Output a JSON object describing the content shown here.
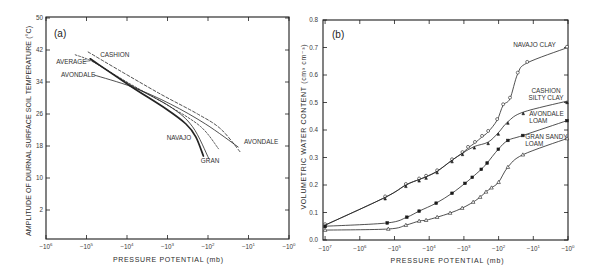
{
  "chart_data": [
    {
      "type": "line",
      "panel_label": "(a)",
      "title": "",
      "xlabel": "PRESSURE POTENTIAL (mb)",
      "ylabel": "AMPLITUDE OF DIURNAL SURFACE SOIL TEMPERATURE (°C)",
      "x_scale": "log (negative pressure potential)",
      "xlim": [
        -1000000,
        -1
      ],
      "ylim": [
        -5,
        50
      ],
      "grid": false,
      "legend": "inline curve labels",
      "x_ticks": [
        {
          "value": -1000000,
          "base": "−10",
          "exp": "6"
        },
        {
          "value": -100000,
          "base": "−10",
          "exp": "5"
        },
        {
          "value": -10000,
          "base": "−10",
          "exp": "4"
        },
        {
          "value": -1000,
          "base": "−10",
          "exp": "3"
        },
        {
          "value": -100,
          "base": "−10",
          "exp": "2"
        },
        {
          "value": -10,
          "base": "−10",
          "exp": "1"
        },
        {
          "value": -1,
          "base": "−10",
          "exp": "0"
        }
      ],
      "y_ticks": [
        {
          "value": 2,
          "label": "2"
        },
        {
          "value": 10,
          "label": "10"
        },
        {
          "value": 18,
          "label": "18"
        },
        {
          "value": 26,
          "label": "26"
        },
        {
          "value": 34,
          "label": "34"
        },
        {
          "value": 42,
          "label": "42"
        },
        {
          "value": 50,
          "label": "50"
        }
      ],
      "series": [
        {
          "name": "CASHION",
          "line_style": "dashed",
          "points": [
            [
              -91000,
              41.5
            ],
            [
              -16000,
              37.0
            ],
            [
              -1500,
              31.0
            ],
            [
              -180,
              26.0
            ],
            [
              -49,
              22.3
            ],
            [
              -16,
              16.5
            ]
          ],
          "labels": [
            {
              "lines": [
                "CASHION"
              ],
              "at": [
                -46000,
                40.25
              ],
              "anchor": "start"
            }
          ]
        },
        {
          "name": "AVERAGE",
          "line_style": "dashed-fine",
          "points": [
            [
              -190000,
              40.8
            ],
            [
              -68000,
              39.0
            ],
            [
              -8300,
              33.5
            ],
            [
              -850,
              27.8
            ],
            [
              -150,
              22.8
            ],
            [
              -55,
              17.3
            ]
          ],
          "labels": [
            {
              "lines": [
                "AVERAGE"
              ],
              "at": [
                -562000,
                38.5
              ],
              "anchor": "start",
              "leader": [
                [
                  -120000,
                  39.1
                ],
                [
                  -81000,
                  39.3
                ]
              ]
            }
          ]
        },
        {
          "name": "AVONDALE",
          "line_style": "solid",
          "points": [
            [
              -65000,
              35.75
            ],
            [
              -7400,
              32.75
            ],
            [
              -850,
              28.5
            ],
            [
              -115,
              23.5
            ],
            [
              -18,
              17.75
            ]
          ],
          "labels": [
            {
              "lines": [
                "AVONDALE"
              ],
              "at": [
                -427000,
                35.25
              ],
              "anchor": "start"
            },
            {
              "lines": [
                "AVONDALE"
              ],
              "at": [
                -13,
                18.5
              ],
              "anchor": "start"
            }
          ]
        },
        {
          "name": "NAVAJO",
          "line_style": "solid-bold",
          "points": [
            [
              -81000,
              39.8
            ],
            [
              -8300,
              33.0
            ],
            [
              -1100,
              27.3
            ],
            [
              -350,
              23.5
            ],
            [
              -200,
              20.3
            ],
            [
              -130,
              15.5
            ]
          ],
          "labels": [
            {
              "lines": [
                "NAVAJO"
              ],
              "at": [
                -1050,
                19.5
              ],
              "anchor": "start"
            }
          ]
        },
        {
          "name": "GRAN",
          "line_style": "solid",
          "points": [
            [
              -72000,
              39.3
            ],
            [
              -8300,
              33.3
            ],
            [
              -850,
              27.8
            ],
            [
              -240,
              22.8
            ],
            [
              -95,
              14.8
            ]
          ],
          "labels": [
            {
              "lines": [
                "GRAN"
              ],
              "at": [
                -150,
                13.75
              ],
              "anchor": "start"
            }
          ]
        }
      ]
    },
    {
      "type": "line",
      "panel_label": "(b)",
      "title": "",
      "xlabel": "PRESSURE POTENTIAL (mb)",
      "ylabel": "VOLUMETRIC WATER CONTENT (cm³ cm⁻³)",
      "x_scale": "log (negative pressure potential)",
      "xlim": [
        -10000000,
        -1
      ],
      "ylim": [
        0.0,
        0.8
      ],
      "grid": false,
      "legend": "inline curve labels",
      "x_ticks": [
        {
          "value": -10000000,
          "base": "−10",
          "exp": "7"
        },
        {
          "value": -1000000,
          "base": "−10",
          "exp": "6"
        },
        {
          "value": -100000,
          "base": "−10",
          "exp": "5"
        },
        {
          "value": -10000,
          "base": "−10",
          "exp": "4"
        },
        {
          "value": -1000,
          "base": "−10",
          "exp": "3"
        },
        {
          "value": -100,
          "base": "−10",
          "exp": "2"
        },
        {
          "value": -10,
          "base": "−10",
          "exp": "1"
        },
        {
          "value": -1,
          "base": "−10",
          "exp": "0"
        }
      ],
      "y_ticks": [
        {
          "value": 0.0,
          "label": "0.0"
        },
        {
          "value": 0.1,
          "label": "0.1"
        },
        {
          "value": 0.2,
          "label": "0.2"
        },
        {
          "value": 0.3,
          "label": "0.3"
        },
        {
          "value": 0.4,
          "label": "0.4"
        },
        {
          "value": 0.5,
          "label": "0.5"
        },
        {
          "value": 0.6,
          "label": "0.6"
        },
        {
          "value": 0.7,
          "label": "0.7"
        },
        {
          "value": 0.8,
          "label": "0.8"
        }
      ],
      "series": [
        {
          "name": "NAVAJO CLAY",
          "line_style": "solid",
          "marker": "circle-open",
          "points": [
            [
              -10000000,
              0.054
            ],
            [
              -186000,
              0.155
            ],
            [
              -47000,
              0.2
            ],
            [
              -19500,
              0.22
            ],
            [
              -12300,
              0.23
            ],
            [
              -5900,
              0.25
            ],
            [
              -2200,
              0.29
            ],
            [
              -1100,
              0.316
            ],
            [
              -760,
              0.335
            ],
            [
              -480,
              0.353
            ],
            [
              -300,
              0.375
            ],
            [
              -200,
              0.393
            ],
            [
              -110,
              0.436
            ],
            [
              -74,
              0.49
            ],
            [
              -47,
              0.514
            ],
            [
              -28,
              0.605
            ],
            [
              -15,
              0.644
            ],
            [
              -1.07,
              0.699
            ]
          ],
          "labels": [
            {
              "lines": [
                "NAVAJO CLAY"
              ],
              "at": [
                -38,
                0.702
              ],
              "anchor": "start"
            }
          ]
        },
        {
          "name": "CASHION SILTY CLAY",
          "line_style": "solid",
          "marker": "triangle-filled",
          "points": [
            [
              -10000000,
              0.054
            ],
            [
              -186000,
              0.155
            ],
            [
              -47000,
              0.2
            ],
            [
              -19500,
              0.22
            ],
            [
              -12300,
              0.23
            ],
            [
              -5900,
              0.25
            ],
            [
              -2200,
              0.29
            ],
            [
              -1100,
              0.316
            ],
            [
              -500,
              0.34
            ],
            [
              -200,
              0.356
            ],
            [
              -102,
              0.39
            ],
            [
              -54,
              0.43
            ],
            [
              -19.5,
              0.465
            ],
            [
              -1.07,
              0.505
            ]
          ],
          "labels": [
            {
              "lines": [
                "CASHION",
                "SILTY CLAY"
              ],
              "at": [
                -4.3,
                0.535
              ],
              "anchor": "middle"
            }
          ]
        },
        {
          "name": "AVONDALE LOAM",
          "line_style": "solid",
          "marker": "square-filled",
          "points": [
            [
              -10000000,
              0.05
            ],
            [
              -162000,
              0.062
            ],
            [
              -44000,
              0.083
            ],
            [
              -19500,
              0.105
            ],
            [
              -6300,
              0.134
            ],
            [
              -2200,
              0.17
            ],
            [
              -930,
              0.206
            ],
            [
              -575,
              0.228
            ],
            [
              -316,
              0.257
            ],
            [
              -214,
              0.28
            ],
            [
              -102,
              0.33
            ],
            [
              -54,
              0.362
            ],
            [
              -20,
              0.38
            ],
            [
              -1.07,
              0.434
            ]
          ],
          "labels": [
            {
              "lines": [
                "AVONDALE",
                "LOAM"
              ],
              "at": [
                -13,
                0.451
              ],
              "anchor": "start"
            }
          ]
        },
        {
          "name": "GRAN SANDY LOAM",
          "line_style": "solid",
          "marker": "triangle-open",
          "points": [
            [
              -10000000,
              0.036
            ],
            [
              -151000,
              0.04
            ],
            [
              -47000,
              0.054
            ],
            [
              -19500,
              0.069
            ],
            [
              -12300,
              0.072
            ],
            [
              -5900,
              0.083
            ],
            [
              -2500,
              0.098
            ],
            [
              -1120,
              0.116
            ],
            [
              -540,
              0.138
            ],
            [
              -340,
              0.156
            ],
            [
              -230,
              0.175
            ],
            [
              -160,
              0.19
            ],
            [
              -100,
              0.21
            ],
            [
              -54,
              0.265
            ],
            [
              -20,
              0.31
            ],
            [
              -1.07,
              0.369
            ]
          ],
          "labels": [
            {
              "lines": [
                "GRAN SANDY",
                "LOAM"
              ],
              "at": [
                -17,
                0.367
              ],
              "anchor": "start"
            }
          ]
        }
      ]
    }
  ]
}
